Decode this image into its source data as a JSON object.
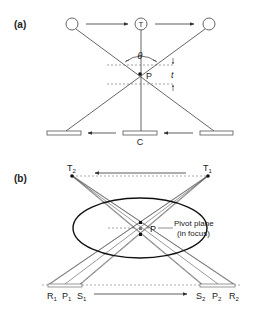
{
  "panel_a": {
    "label": "(a)",
    "tube_label": "T",
    "angle_label": "θ",
    "pivot_label": "P",
    "thickness_label": "t",
    "film_label": "C"
  },
  "panel_b": {
    "label": "(b)",
    "tube_positions": [
      {
        "main": "T",
        "sub": "2"
      },
      {
        "main": "T",
        "sub": "1"
      }
    ],
    "pivot_label": "P",
    "pivot_plane_line1": "Pivot plane",
    "pivot_plane_line2": "(in focus)",
    "film_labels_left": [
      {
        "main": "R",
        "sub": "1"
      },
      {
        "main": "P",
        "sub": "1"
      },
      {
        "main": "S",
        "sub": "1"
      }
    ],
    "film_labels_right": [
      {
        "main": "S",
        "sub": "2"
      },
      {
        "main": "P",
        "sub": "2"
      },
      {
        "main": "R",
        "sub": "2"
      }
    ]
  },
  "colors": {
    "line": "#555555",
    "text": "#222222",
    "dark": "#111111"
  }
}
